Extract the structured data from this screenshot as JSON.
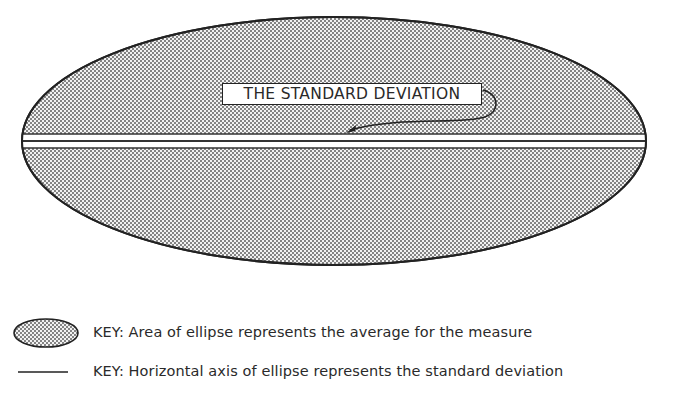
{
  "diagram": {
    "callout_label": "THE STANDARD DEVIATION",
    "fill_pattern": "stippled-dots",
    "colors": {
      "outline": "#222222",
      "fill_dot": "#555555",
      "background": "#ffffff",
      "text": "#2a2a2a"
    }
  },
  "legend": {
    "items": [
      {
        "symbol": "shaded-ellipse",
        "label": "KEY: Area of ellipse represents the average for the measure"
      },
      {
        "symbol": "horizontal-line",
        "label": "KEY: Horizontal axis of ellipse represents the standard deviation"
      }
    ]
  }
}
